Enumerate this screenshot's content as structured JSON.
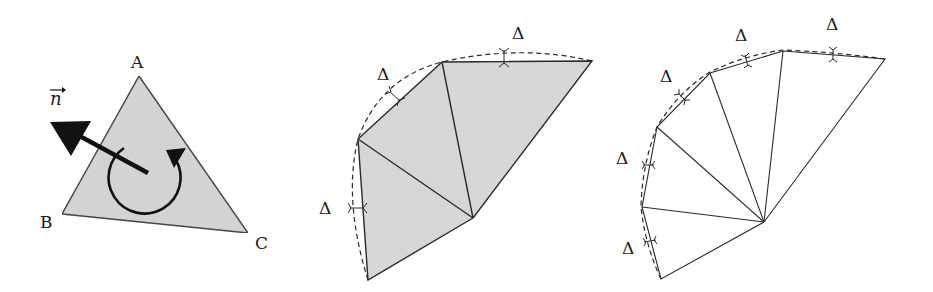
{
  "figure": {
    "panels": [
      {
        "id": "triangle-normal",
        "labels": {
          "normal": "n",
          "vertex_a": "A",
          "vertex_b": "B",
          "vertex_c": "C"
        },
        "fill_color": "#d6d6d6"
      },
      {
        "id": "coarse-fan",
        "delta_labels": [
          "Δ",
          "Δ",
          "Δ"
        ],
        "fill_color": "#d9d9d9"
      },
      {
        "id": "fine-fan",
        "delta_labels": [
          "Δ",
          "Δ",
          "Δ",
          "Δ",
          "Δ",
          "Δ"
        ],
        "fill_color": "#ffffff"
      }
    ]
  }
}
